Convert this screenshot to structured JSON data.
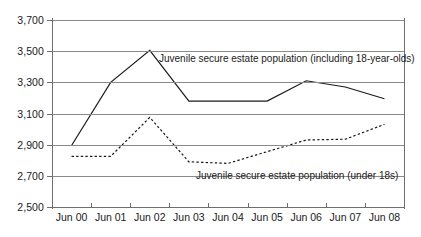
{
  "chart_data": {
    "type": "line",
    "title": "",
    "subtitle": "",
    "xlabel": "",
    "ylabel": "",
    "categories": [
      "Jun 00",
      "Jun 01",
      "Jun 02",
      "Jun 03",
      "Jun 04",
      "Jun 05",
      "Jun 06",
      "Jun 07",
      "Jun 08"
    ],
    "ylim": [
      2500,
      3700
    ],
    "ytick_labels": [
      "3,700",
      "3,500",
      "3,300",
      "3,100",
      "2,900",
      "2,700",
      "2,500"
    ],
    "ytick_values": [
      3700,
      3500,
      3300,
      3100,
      2900,
      2700,
      2500
    ],
    "ytick_step": 200,
    "grid": true,
    "grid_axis": "y",
    "legend_position": "inline-annotation",
    "series": [
      {
        "name": "Juvenile secure estate population (including 18-year-olds)",
        "style": "solid",
        "color": "#1a1a1a",
        "values": [
          2895,
          3300,
          3505,
          3180,
          3180,
          3180,
          3310,
          3270,
          3195
        ]
      },
      {
        "name": "Juvenile secure estate population (under 18s)",
        "style": "dashed",
        "color": "#1a1a1a",
        "values": [
          2825,
          2825,
          3075,
          2790,
          2780,
          2855,
          2930,
          2935,
          3030
        ]
      }
    ],
    "annotations": [
      {
        "id": "upper",
        "text": "Juvenile secure estate population (including 18-year-olds)"
      },
      {
        "id": "lower",
        "text": "Juvenile secure estate population (under 18s)"
      }
    ]
  }
}
